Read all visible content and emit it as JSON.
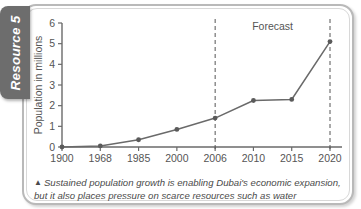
{
  "resource_tab": {
    "label": "Resource 5"
  },
  "caption": {
    "marker_icon": "up-triangle-icon",
    "marker_glyph": "▲",
    "text": "Sustained population growth is enabling Dubai's economic expansion, but it also places pressure on scarce resources such as water"
  },
  "colors": {
    "tab_background": "#6d6d6d",
    "tab_text": "#ffffff",
    "frame_border": "#b9b9b9",
    "axis": "#6a6a6a",
    "series_line": "#6a6a6a",
    "marker": "#5a5a5a",
    "forecast_divider": "#555555",
    "text": "#555555",
    "page_background": "#ffffff"
  },
  "chart_data": {
    "type": "line",
    "title": "",
    "xlabel": "Year",
    "ylabel": "Population in millions",
    "categories": [
      "1900",
      "1968",
      "1985",
      "2000",
      "2006",
      "2010",
      "2015",
      "2020"
    ],
    "values": [
      0.0,
      0.05,
      0.35,
      0.85,
      1.4,
      2.25,
      2.3,
      5.1
    ],
    "series": [
      {
        "name": "Population",
        "values": [
          0.0,
          0.05,
          0.35,
          0.85,
          1.4,
          2.25,
          2.3,
          5.1
        ]
      }
    ],
    "ylim": [
      0,
      6
    ],
    "y_ticks": [
      "0",
      "1",
      "2",
      "3",
      "4",
      "5",
      "6"
    ],
    "x_ticks": [
      "1900",
      "1968",
      "1985",
      "2000",
      "2006",
      "2010",
      "2015",
      "2020"
    ],
    "grid": false,
    "legend": "none",
    "markers": true,
    "annotations": [
      {
        "name": "forecast-label",
        "text": "Forecast",
        "at_x": "between 2006 and 2020"
      },
      {
        "name": "forecast-divider-2006",
        "text": "",
        "at_x": "2006",
        "style": "dashed vertical line"
      },
      {
        "name": "forecast-divider-2020",
        "text": "",
        "at_x": "2020",
        "style": "dashed vertical line"
      }
    ]
  }
}
